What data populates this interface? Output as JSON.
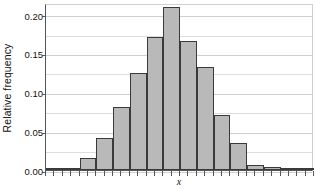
{
  "chart_data": {
    "type": "bar",
    "title": "",
    "subtitle": "",
    "xlabel": "x",
    "ylabel": "Relative frequency",
    "ylim": [
      0.0,
      0.215
    ],
    "yticks": [
      "0.00",
      "0.05",
      "0.10",
      "0.15",
      "0.20"
    ],
    "ytick_values": [
      0.0,
      0.05,
      0.1,
      0.15,
      0.2
    ],
    "grid": "horizontal-minor-every-0.025",
    "legend": "none",
    "bar_style": {
      "fill": "#b9b9b9",
      "edge": "#3a3a3a",
      "gap": 0
    },
    "categories": [
      "bin-1",
      "bin-2",
      "bin-3",
      "bin-4",
      "bin-5",
      "bin-6",
      "bin-7",
      "bin-8",
      "bin-9",
      "bin-10",
      "bin-11",
      "bin-12",
      "bin-13",
      "bin-14",
      "bin-15",
      "bin-16"
    ],
    "values": [
      0.002,
      0.002,
      0.015,
      0.041,
      0.081,
      0.125,
      0.171,
      0.21,
      0.166,
      0.133,
      0.071,
      0.035,
      0.007,
      0.004,
      0.002,
      0.002
    ]
  },
  "axes": {
    "y_title": "Relative frequency",
    "x_title": "x"
  }
}
